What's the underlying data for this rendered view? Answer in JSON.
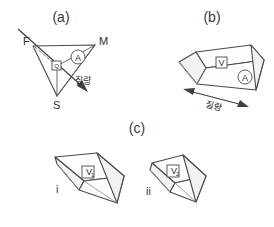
{
  "figure": {
    "width": 274,
    "height": 227,
    "background": "#ffffff",
    "ink_color": "#4a4a4a"
  },
  "panels": [
    {
      "id": "a",
      "label": "(a)",
      "type": "triangle-construction",
      "vertex_labels": [
        "F",
        "M",
        "S"
      ],
      "badges": [
        {
          "name": "circled-a",
          "text": "A",
          "shape": "circle"
        },
        {
          "name": "boxed-q",
          "text": "Q",
          "shape": "box"
        }
      ],
      "annotation": "질량"
    },
    {
      "id": "b",
      "label": "(b)",
      "type": "wedge-3d",
      "badges": [
        {
          "name": "boxed-v",
          "text": "V",
          "shape": "box"
        },
        {
          "name": "circled-a",
          "text": "A",
          "shape": "circle"
        }
      ],
      "annotation": "질량"
    },
    {
      "id": "c",
      "label": "(c)",
      "type": "wedge-pair",
      "items": [
        {
          "roman": "i",
          "badge": {
            "name": "boxed-v1",
            "text": "V",
            "sub": "1",
            "shape": "box"
          }
        },
        {
          "roman": "ii",
          "badge": {
            "name": "boxed-v2",
            "text": "V",
            "sub": "2",
            "shape": "box"
          }
        }
      ]
    }
  ],
  "labels": {
    "panel_a": "(a)",
    "panel_b": "(b)",
    "panel_c": "(c)",
    "point_f": "F",
    "point_m": "M",
    "point_s": "S",
    "badge_a_circle_panel_a": "A",
    "badge_q_box": "Q",
    "badge_v_box": "V",
    "badge_a_circle_panel_b": "A",
    "badge_v1": "V",
    "badge_v1_sub": "1",
    "badge_v2": "V",
    "badge_v2_sub": "2",
    "roman_i": "i",
    "roman_ii": "ii",
    "mass_ko_a": "질량",
    "mass_ko_b": "질량"
  }
}
